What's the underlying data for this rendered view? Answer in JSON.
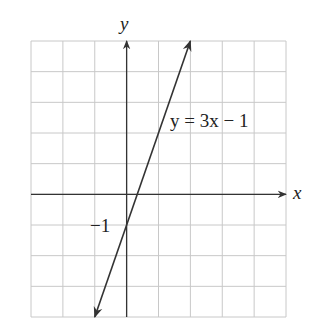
{
  "chart_data": {
    "type": "line",
    "title": "",
    "xlabel": "x",
    "ylabel": "y",
    "xlim": [
      -3,
      5
    ],
    "ylim": [
      -4,
      5
    ],
    "grid": true,
    "legend": null,
    "tick_labels": [
      {
        "axis": "y",
        "value": -1,
        "label": "−1"
      }
    ],
    "series": [
      {
        "name": "y = 3x − 1",
        "equation": "y = 3x - 1",
        "slope": 3,
        "intercept": -1,
        "x": [
          -1,
          2
        ],
        "y": [
          -4,
          5
        ],
        "arrows": "both"
      }
    ],
    "annotations": [
      {
        "text": "y = 3x − 1",
        "x": 2.3,
        "y": 3
      }
    ]
  },
  "labels": {
    "x_axis": "x",
    "y_axis": "y",
    "y_intercept": "−1",
    "equation": "y = 3x − 1"
  },
  "colors": {
    "grid": "#c8c8c8",
    "axis": "#333333",
    "line": "#333333"
  }
}
